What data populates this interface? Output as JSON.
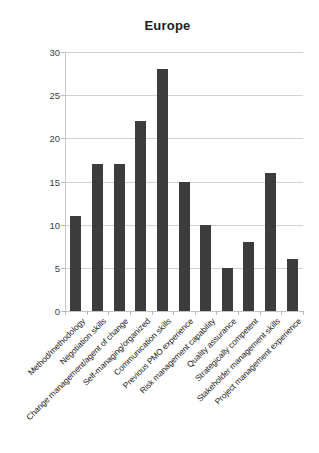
{
  "chart_data": {
    "type": "bar",
    "title": "Europe",
    "xlabel": "",
    "ylabel": "",
    "ylim": [
      0,
      30
    ],
    "yticks": [
      0,
      5,
      10,
      15,
      20,
      25,
      30
    ],
    "grid": true,
    "legend": "none",
    "bar_color": "#3c3c3c",
    "gridline_color": "#d2d2d2",
    "categories": [
      "Method/methodology",
      "Negotiation skills",
      "Change management/agent of change",
      "Self-managing/organized",
      "Communication skills",
      "Previous PMO experience",
      "Risk management capability",
      "Quality assurance",
      "Strategically competent",
      "Stakeholder management skills",
      "Project management experience"
    ],
    "values": [
      11,
      17,
      17,
      22,
      28,
      15,
      10,
      5,
      8,
      16,
      6
    ]
  }
}
